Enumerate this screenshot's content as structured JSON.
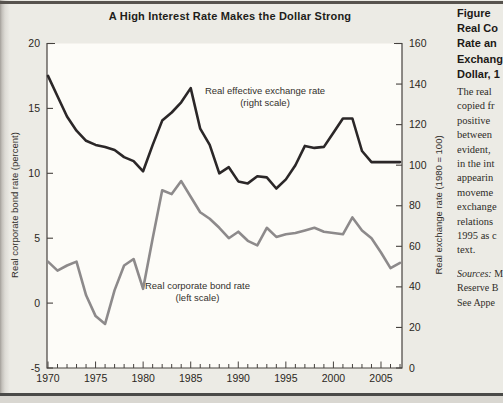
{
  "chart_data": {
    "type": "line",
    "title": "A High Interest Rate Makes the Dollar Strong",
    "x": [
      1970,
      1971,
      1972,
      1973,
      1974,
      1975,
      1976,
      1977,
      1978,
      1979,
      1980,
      1981,
      1982,
      1983,
      1984,
      1985,
      1986,
      1987,
      1988,
      1989,
      1990,
      1991,
      1992,
      1993,
      1994,
      1995,
      1996,
      1997,
      1998,
      1999,
      2000,
      2001,
      2002,
      2003,
      2004,
      2005,
      2006,
      2007
    ],
    "series": [
      {
        "name": "Real effective exchange rate",
        "scale": "right",
        "color": "#2b2728",
        "values": [
          144,
          134,
          124,
          117,
          112,
          110,
          109,
          107.5,
          104,
          102,
          97,
          110,
          122,
          126,
          131,
          138,
          118,
          110,
          96,
          99,
          92,
          91,
          94.5,
          94,
          88.5,
          93,
          100,
          109.5,
          108.5,
          109,
          116,
          123,
          123,
          107,
          101.5,
          101.5,
          101.5,
          101.5
        ]
      },
      {
        "name": "Real corporate bond rate",
        "scale": "left",
        "color": "#8d8a8b",
        "values": [
          3.2,
          2.5,
          2.9,
          3.2,
          0.6,
          -1.0,
          -1.6,
          1.0,
          2.9,
          3.4,
          1.1,
          5.0,
          8.7,
          8.4,
          9.4,
          8.2,
          7.0,
          6.5,
          5.8,
          5.0,
          5.5,
          4.8,
          4.45,
          5.8,
          5.1,
          5.3,
          5.4,
          5.6,
          5.8,
          5.5,
          5.4,
          5.3,
          6.6,
          5.6,
          5.0,
          3.9,
          2.7,
          3.1
        ]
      }
    ],
    "left_axis": {
      "label": "Real corporate bond rate (percent)",
      "min": -5,
      "max": 20,
      "ticks": [
        20,
        15,
        10,
        5,
        0,
        -5
      ]
    },
    "right_axis": {
      "label": "Real exchange rate (1980 = 100)",
      "min": 0,
      "max": 160,
      "ticks": [
        160,
        140,
        120,
        100,
        80,
        60,
        40,
        20,
        0
      ]
    },
    "x_axis": {
      "labeled_ticks": [
        1970,
        1975,
        1980,
        1985,
        1990,
        1995,
        2000,
        2005
      ],
      "minor_ticks_every_year": true,
      "range": [
        1970,
        2007
      ]
    },
    "legend_position": "inline-annotations",
    "grid": false,
    "annotations": [
      {
        "line1": "Real effective exchange rate",
        "line2": "(right scale)"
      },
      {
        "line1": "Real corporate bond rate",
        "line2": "(left scale)"
      }
    ]
  },
  "sidebar": {
    "heading_lines": [
      "Figure",
      "Real Co",
      "Rate an",
      "Exchang",
      "Dollar, 1"
    ],
    "body_lines": [
      "The real",
      "copied fr",
      "positive",
      "between",
      "evident,",
      "in the int",
      "appearin",
      "moveme",
      "exchange",
      "relations",
      "1995 as c",
      "text."
    ],
    "sources_label": "Sources:",
    "sources_first_rest": " M",
    "sources_lines": [
      "Reserve B",
      "See Appe"
    ]
  }
}
